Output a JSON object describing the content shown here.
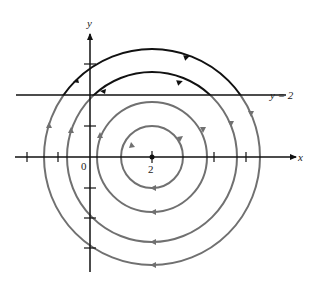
{
  "figure": {
    "type": "phase-portrait",
    "axes": {
      "x_label": "x",
      "y_label": "y",
      "origin_label": "0",
      "center_label": "2",
      "line_label": "y = 2"
    },
    "center": {
      "x": 2,
      "y": 0
    },
    "horizontal_line": {
      "y": 2
    },
    "orbits": [
      {
        "radius_units": 1.0,
        "color": "#6e6e6e"
      },
      {
        "radius_units": 1.77,
        "color": "#6e6e6e"
      },
      {
        "radius_units": 2.74,
        "color": "#6e6e6e",
        "above_line_color": "#111111"
      },
      {
        "radius_units": 3.5,
        "color": "#6e6e6e",
        "above_line_color": "#111111"
      }
    ],
    "colors": {
      "axis": "#111111",
      "orbit_gray": "#707070",
      "orbit_black": "#111111"
    }
  }
}
